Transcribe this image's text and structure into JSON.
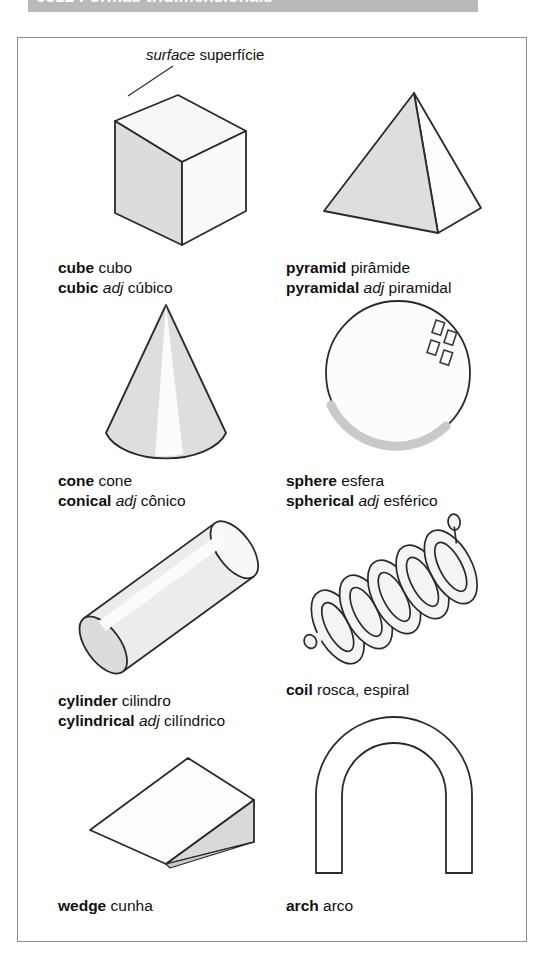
{
  "page": {
    "header_title": "6512 Formas tridimensionais",
    "header_bg": "#b9b9b9",
    "frame_color": "#8d8d8d",
    "ink_color": "#1a1a1a",
    "fill_color": "#e2e2e2"
  },
  "callout": {
    "en": "surface",
    "pt": "superfície"
  },
  "entries": [
    {
      "id": "cube",
      "shape": "cube",
      "lines": [
        {
          "en": "cube",
          "pos": "",
          "pt": "cubo"
        },
        {
          "en": "cubic",
          "pos": "adj",
          "pt": "cúbico"
        }
      ]
    },
    {
      "id": "pyramid",
      "shape": "pyramid",
      "lines": [
        {
          "en": "pyramid",
          "pos": "",
          "pt": "pirâmide"
        },
        {
          "en": "pyramidal",
          "pos": "adj",
          "pt": "piramidal"
        }
      ]
    },
    {
      "id": "cone",
      "shape": "cone",
      "lines": [
        {
          "en": "cone",
          "pos": "",
          "pt": "cone"
        },
        {
          "en": "conical",
          "pos": "adj",
          "pt": "cônico"
        }
      ]
    },
    {
      "id": "sphere",
      "shape": "sphere",
      "lines": [
        {
          "en": "sphere",
          "pos": "",
          "pt": "esfera"
        },
        {
          "en": "spherical",
          "pos": "adj",
          "pt": "esférico"
        }
      ]
    },
    {
      "id": "cylinder",
      "shape": "cylinder",
      "lines": [
        {
          "en": "cylinder",
          "pos": "",
          "pt": "cilindro"
        },
        {
          "en": "cylindrical",
          "pos": "adj",
          "pt": "cilíndrico"
        }
      ]
    },
    {
      "id": "coil",
      "shape": "coil",
      "lines": [
        {
          "en": "coil",
          "pos": "",
          "pt": "rosca, espiral"
        }
      ]
    },
    {
      "id": "wedge",
      "shape": "wedge",
      "lines": [
        {
          "en": "wedge",
          "pos": "",
          "pt": "cunha"
        }
      ]
    },
    {
      "id": "arch",
      "shape": "arch",
      "lines": [
        {
          "en": "arch",
          "pos": "",
          "pt": "arco"
        }
      ]
    }
  ]
}
